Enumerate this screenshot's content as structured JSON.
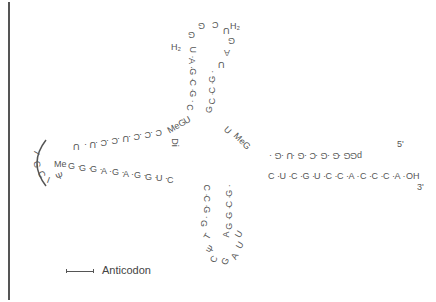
{
  "legend": {
    "anticodon_label": "Anticodon"
  },
  "acceptor_stem": {
    "five_prime_label": "5'",
    "top_strand": "pG-G-G-G-C-G-U-G",
    "bottom_strand": "C-U-C-G-U-C-C-A-C-C-C-A-OH",
    "three_prime_label": "3'"
  },
  "d_arm": {
    "loop": "H2U-A-G-G-G-C-H2U-G-A",
    "left_strand": "U-A-G-C-G-C",
    "right_strand": "G-C-C-G",
    "modified": [
      "H2",
      "H2"
    ]
  },
  "connector": {
    "left": "C-U-MeG",
    "right": "MeG-U",
    "extra": "Di"
  },
  "anticodon_arm": {
    "top_strand": "C-C-C-U-C-C-U-U",
    "bottom_strand": "G-G-G-A-G-A-G-G-U-C",
    "loop": "I-G-C-Ψ-I",
    "me_label": "Me"
  },
  "t_arm": {
    "left_strand": "C-C-G-G",
    "right_strand": "G-C-G-G-A",
    "loop": "T-Ψ-C-G-A-U-U"
  }
}
